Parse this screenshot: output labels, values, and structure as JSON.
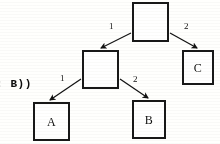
{
  "figure": {
    "kind": "binary-tree-diagram",
    "background_color": "#fdfdfb",
    "ink_color": "#1a1a1a"
  },
  "code_fragment": {
    "text": ": B))",
    "note_clipped_left": true
  },
  "nodes": [
    {
      "id": "root",
      "label": "",
      "x": 132,
      "y": 2,
      "w": 37,
      "h": 40
    },
    {
      "id": "middle",
      "label": "",
      "x": 82,
      "y": 50,
      "w": 37,
      "h": 39
    },
    {
      "id": "c",
      "label": "C",
      "x": 182,
      "y": 50,
      "w": 32,
      "h": 35
    },
    {
      "id": "a",
      "label": "A",
      "x": 33,
      "y": 102,
      "w": 37,
      "h": 39
    },
    {
      "id": "b",
      "label": "B",
      "x": 132,
      "y": 100,
      "w": 34,
      "h": 39
    }
  ],
  "edges": [
    {
      "from": "root",
      "to": "middle",
      "label": "1",
      "label_x": 109,
      "label_y": 22,
      "x1": 131,
      "y1": 33,
      "x2": 101,
      "y2": 48
    },
    {
      "from": "root",
      "to": "c",
      "label": "2",
      "label_x": 184,
      "label_y": 22,
      "x1": 170,
      "y1": 33,
      "x2": 197,
      "y2": 48
    },
    {
      "from": "middle",
      "to": "a",
      "label": "1",
      "label_x": 60,
      "label_y": 74,
      "x1": 81,
      "y1": 79,
      "x2": 50,
      "y2": 100
    },
    {
      "from": "middle",
      "to": "b",
      "label": "2",
      "label_x": 133,
      "label_y": 75,
      "x1": 120,
      "y1": 79,
      "x2": 148,
      "y2": 98
    }
  ]
}
